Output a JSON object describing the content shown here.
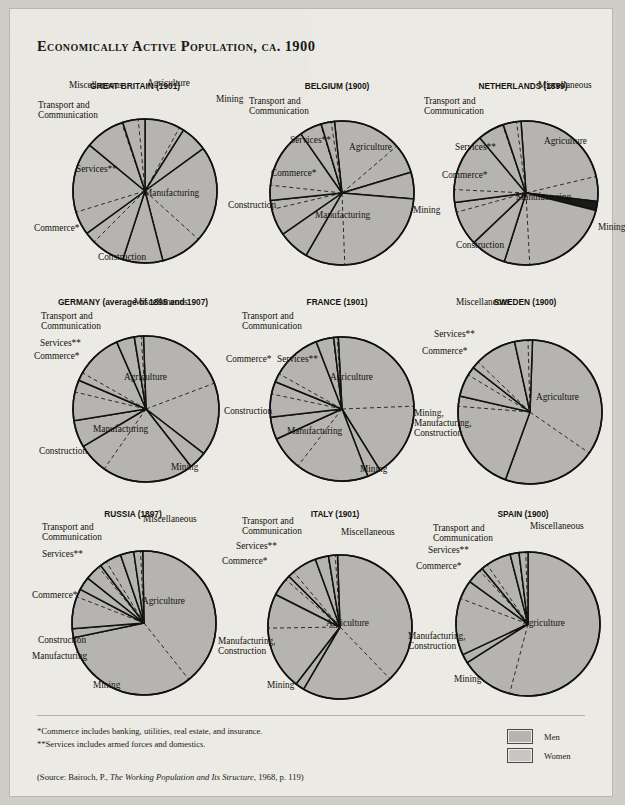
{
  "page": {
    "title": "Economically Active Population, ca. 1900",
    "paper_color": "#eceae4",
    "slice_fill": "#b6b4b0",
    "slice_fill_dark": "#1a1a1a"
  },
  "footnotes": [
    "*Commerce includes banking, utilities, real estate, and insurance.",
    "**Services includes armed forces and domestics."
  ],
  "source": "(Source: Bairoch, P., The Working Population and Its Structure, 1968, p. 119)",
  "source_parts": {
    "pre": "(Source: Bairoch, P., ",
    "italic": "The Working Population and Its Structure",
    "post": ", 1968, p. 119)"
  },
  "legend": {
    "items": [
      {
        "label": "Men",
        "color": "#b6b4b0"
      },
      {
        "label": "Women",
        "color": "#c8c6c2"
      }
    ]
  },
  "chart_data": [
    {
      "type": "pie",
      "title": "GREAT BRITAIN (1901)",
      "categories": [
        "Agriculture",
        "Mining",
        "Manufacturing",
        "Construction",
        "Commerce*",
        "Services**",
        "Transport and Communication",
        "Miscellaneous"
      ],
      "values": [
        9,
        6,
        31,
        9,
        10,
        21,
        9,
        5
      ],
      "women_share": [
        0.12,
        0.02,
        0.3,
        0.01,
        0.25,
        0.75,
        0.03,
        0.3
      ],
      "labels": [
        {
          "text": "Agriculture",
          "x": 107,
          "y": -2,
          "align": "left"
        },
        {
          "text": "Mining",
          "x": 176,
          "y": 14,
          "align": "left"
        },
        {
          "text": "Manufacturing",
          "x": 104,
          "y": 108,
          "align": "left"
        },
        {
          "text": "Construction",
          "x": 58,
          "y": 172,
          "align": "left"
        },
        {
          "text": "Commerce*",
          "x": -6,
          "y": 143,
          "align": "left"
        },
        {
          "text": "Services**",
          "x": 36,
          "y": 84,
          "align": "left"
        },
        {
          "text": "Transport and\nCommunication",
          "x": -2,
          "y": 20,
          "align": "left"
        },
        {
          "text": "Miscellaneous",
          "x": 29,
          "y": 0,
          "align": "left"
        }
      ]
    },
    {
      "type": "pie",
      "title": "BELGIUM (1900)",
      "categories": [
        "Agriculture",
        "Mining",
        "Manufacturing",
        "Construction",
        "Commerce*",
        "Services**",
        "Transport and Communication",
        "Miscellaneous"
      ],
      "values": [
        22,
        6,
        32,
        7,
        8,
        17,
        5,
        3
      ],
      "women_share": [
        0.3,
        0.02,
        0.28,
        0.01,
        0.25,
        0.8,
        0.03,
        0.25
      ],
      "labels": [
        {
          "text": "Agriculture",
          "x": 107,
          "y": 62,
          "align": "left"
        },
        {
          "text": "Mining",
          "x": 171,
          "y": 125,
          "align": "left"
        },
        {
          "text": "Manufacturing",
          "x": 73,
          "y": 130,
          "align": "left"
        },
        {
          "text": "Construction",
          "x": -14,
          "y": 120,
          "align": "left"
        },
        {
          "text": "Commerce*",
          "x": 29,
          "y": 88,
          "align": "left"
        },
        {
          "text": "Services**",
          "x": 48,
          "y": 55,
          "align": "left"
        },
        {
          "text": "Transport and\nCommunication",
          "x": 7,
          "y": 16,
          "align": "left"
        }
      ]
    },
    {
      "type": "pie",
      "title": "NETHERLANDS (1899)",
      "categories": [
        "Agriculture",
        "Mining",
        "Manufacturing",
        "Construction",
        "Commerce*",
        "Services**",
        "Transport and Communication",
        "Miscellaneous"
      ],
      "values": [
        28,
        2,
        26,
        8,
        10,
        16,
        6,
        4
      ],
      "women_share": [
        0.2,
        0.01,
        0.22,
        0.01,
        0.22,
        0.82,
        0.03,
        0.25
      ],
      "labels": [
        {
          "text": "Agriculture",
          "x": 116,
          "y": 56,
          "align": "left"
        },
        {
          "text": "Mining",
          "x": 170,
          "y": 142,
          "align": "left"
        },
        {
          "text": "Manufacturing",
          "x": 88,
          "y": 112,
          "align": "left"
        },
        {
          "text": "Construction",
          "x": 28,
          "y": 160,
          "align": "left"
        },
        {
          "text": "Commerce*",
          "x": 14,
          "y": 90,
          "align": "left"
        },
        {
          "text": "Services**",
          "x": 27,
          "y": 62,
          "align": "left"
        },
        {
          "text": "Transport and\nCommunication",
          "x": -4,
          "y": 16,
          "align": "left"
        },
        {
          "text": "Miscellaneous",
          "x": 110,
          "y": 0,
          "align": "left"
        }
      ]
    },
    {
      "type": "pie",
      "title": "GERMANY (average of 1895 and 1907)",
      "categories": [
        "Agriculture",
        "Mining",
        "Manufacturing",
        "Construction",
        "Commerce*",
        "Services**",
        "Transport and Communication",
        "Miscellaneous"
      ],
      "values": [
        36,
        4,
        27,
        6,
        9,
        12,
        4,
        2
      ],
      "women_share": [
        0.45,
        0.02,
        0.25,
        0.01,
        0.3,
        0.85,
        0.03,
        0.25
      ],
      "labels": [
        {
          "text": "Agriculture",
          "x": 86,
          "y": 76,
          "align": "left"
        },
        {
          "text": "Mining",
          "x": 133,
          "y": 166,
          "align": "left"
        },
        {
          "text": "Manufacturing",
          "x": 55,
          "y": 128,
          "align": "left"
        },
        {
          "text": "Construction",
          "x": 1,
          "y": 150,
          "align": "left"
        },
        {
          "text": "Commerce*",
          "x": -4,
          "y": 55,
          "align": "left"
        },
        {
          "text": "Services**",
          "x": 2,
          "y": 42,
          "align": "left"
        },
        {
          "text": "Transport and\nCommunication",
          "x": 3,
          "y": 15,
          "align": "left"
        },
        {
          "text": "Miscellaneous",
          "x": 96,
          "y": 1,
          "align": "left"
        }
      ]
    },
    {
      "type": "pie",
      "title": "FRANCE (1901)",
      "categories": [
        "Agriculture",
        "Mining",
        "Manufacturing",
        "Construction",
        "Commerce*",
        "Services**",
        "Transport and Communication",
        "Miscellaneous"
      ],
      "values": [
        42,
        3,
        24,
        5,
        8,
        13,
        4,
        1
      ],
      "women_share": [
        0.4,
        0.02,
        0.32,
        0.01,
        0.35,
        0.85,
        0.03,
        0.25
      ],
      "labels": [
        {
          "text": "Agriculture",
          "x": 88,
          "y": 76,
          "align": "left"
        },
        {
          "text": "Mining",
          "x": 118,
          "y": 168,
          "align": "left"
        },
        {
          "text": "Manufacturing",
          "x": 45,
          "y": 130,
          "align": "left"
        },
        {
          "text": "Construction",
          "x": -18,
          "y": 110,
          "align": "left"
        },
        {
          "text": "Commerce*",
          "x": -16,
          "y": 58,
          "align": "left"
        },
        {
          "text": "Services**",
          "x": 35,
          "y": 58,
          "align": "left"
        },
        {
          "text": "Transport and\nCommunication",
          "x": 0,
          "y": 15,
          "align": "left"
        }
      ]
    },
    {
      "type": "pie",
      "title": "SWEDEN (1900)",
      "categories": [
        "Agriculture",
        "Mining, Manufacturing, Construction",
        "Commerce*",
        "Services**",
        "Miscellaneous"
      ],
      "values": [
        55,
        23,
        7,
        11,
        4
      ],
      "women_share": [
        0.38,
        0.1,
        0.28,
        0.85,
        0.25
      ],
      "labels": [
        {
          "text": "Agriculture",
          "x": 106,
          "y": 96,
          "align": "left"
        },
        {
          "text": "Mining,\nManufacturing,\nConstruction",
          "x": -16,
          "y": 112,
          "align": "left"
        },
        {
          "text": "Commerce*",
          "x": -8,
          "y": 50,
          "align": "left"
        },
        {
          "text": "Services**",
          "x": 4,
          "y": 33,
          "align": "left"
        },
        {
          "text": "Miscellaneous",
          "x": 26,
          "y": 1,
          "align": "left"
        }
      ]
    },
    {
      "type": "pie",
      "title": "RUSSIA (1897)",
      "categories": [
        "Agriculture",
        "Mining",
        "Manufacturing",
        "Construction",
        "Commerce*",
        "Services**",
        "Transport and Communication",
        "Miscellaneous"
      ],
      "values": [
        72,
        2,
        9,
        3,
        4,
        5,
        3,
        2
      ],
      "women_share": [
        0.45,
        0.02,
        0.2,
        0.01,
        0.15,
        0.7,
        0.02,
        0.25
      ],
      "labels": [
        {
          "text": "Agriculture",
          "x": 104,
          "y": 88,
          "align": "left"
        },
        {
          "text": "Mining",
          "x": 55,
          "y": 172,
          "align": "left"
        },
        {
          "text": "Manufacturing",
          "x": -6,
          "y": 143,
          "align": "left"
        },
        {
          "text": "Construction",
          "x": 0,
          "y": 127,
          "align": "left"
        },
        {
          "text": "Commerce*",
          "x": -6,
          "y": 82,
          "align": "left"
        },
        {
          "text": "Services**",
          "x": 4,
          "y": 41,
          "align": "left"
        },
        {
          "text": "Transport and\nCommunication",
          "x": 4,
          "y": 14,
          "align": "left"
        },
        {
          "text": "Miscellaneous",
          "x": 105,
          "y": 6,
          "align": "left"
        }
      ]
    },
    {
      "type": "pie",
      "title": "ITALY (1901)",
      "categories": [
        "Agriculture",
        "Mining",
        "Manufacturing, Construction",
        "Commerce*",
        "Services**",
        "Transport and Communication",
        "Miscellaneous"
      ],
      "values": [
        59,
        2,
        22,
        5,
        7,
        3,
        2
      ],
      "women_share": [
        0.35,
        0.02,
        0.35,
        0.2,
        0.8,
        0.03,
        0.25
      ],
      "labels": [
        {
          "text": "Agriculture",
          "x": 86,
          "y": 110,
          "align": "left"
        },
        {
          "text": "Mining",
          "x": 27,
          "y": 172,
          "align": "left"
        },
        {
          "text": "Manufacturing,\nConstruction",
          "x": -22,
          "y": 128,
          "align": "left"
        },
        {
          "text": "Commerce*",
          "x": -18,
          "y": 48,
          "align": "left"
        },
        {
          "text": "Services**",
          "x": -4,
          "y": 33,
          "align": "left"
        },
        {
          "text": "Transport and\nCommunication",
          "x": 2,
          "y": 8,
          "align": "left"
        },
        {
          "text": "Miscellaneous",
          "x": 101,
          "y": 19,
          "align": "left"
        }
      ]
    },
    {
      "type": "pie",
      "title": "SPAIN (1900)",
      "categories": [
        "Agriculture",
        "Mining",
        "Manufacturing, Construction",
        "Commerce*",
        "Services**",
        "Transport and Communication",
        "Miscellaneous"
      ],
      "values": [
        66,
        2,
        17,
        4,
        7,
        2,
        2
      ],
      "women_share": [
        0.18,
        0.02,
        0.25,
        0.18,
        0.8,
        0.03,
        0.25
      ],
      "labels": [
        {
          "text": "Agriculture",
          "x": 94,
          "y": 110,
          "align": "left"
        },
        {
          "text": "Mining",
          "x": 26,
          "y": 166,
          "align": "left"
        },
        {
          "text": "Manufacturing,\nConstruction",
          "x": -20,
          "y": 123,
          "align": "left"
        },
        {
          "text": "Commerce*",
          "x": -12,
          "y": 53,
          "align": "left"
        },
        {
          "text": "Services**",
          "x": 0,
          "y": 37,
          "align": "left"
        },
        {
          "text": "Transport and\nCommunication",
          "x": 5,
          "y": 15,
          "align": "left"
        },
        {
          "text": "Miscellaneous",
          "x": 102,
          "y": 13,
          "align": "left"
        }
      ]
    }
  ],
  "layout": {
    "charts": [
      {
        "left": 30,
        "top": 72,
        "cx": 105,
        "cy": 110,
        "r": 72,
        "rot": -90
      },
      {
        "left": 232,
        "top": 72,
        "cx": 100,
        "cy": 112,
        "r": 72,
        "rot": -96
      },
      {
        "left": 418,
        "top": 72,
        "cx": 98,
        "cy": 112,
        "r": 72,
        "rot": -94
      },
      {
        "left": 28,
        "top": 288,
        "cx": 108,
        "cy": 112,
        "r": 73,
        "rot": -92
      },
      {
        "left": 232,
        "top": 288,
        "cx": 100,
        "cy": 112,
        "r": 72,
        "rot": -93
      },
      {
        "left": 420,
        "top": 288,
        "cx": 100,
        "cy": 115,
        "r": 72,
        "rot": -88
      },
      {
        "left": 28,
        "top": 500,
        "cx": 106,
        "cy": 114,
        "r": 72,
        "rot": -91
      },
      {
        "left": 230,
        "top": 500,
        "cx": 100,
        "cy": 118,
        "r": 72,
        "rot": -92
      },
      {
        "left": 418,
        "top": 500,
        "cx": 100,
        "cy": 115,
        "r": 72,
        "rot": -90
      }
    ]
  }
}
